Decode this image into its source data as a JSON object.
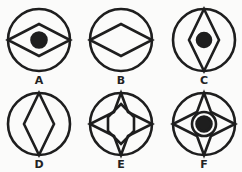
{
  "figures": [
    {
      "label": "A",
      "cx": 39,
      "cy": 40,
      "r": 33,
      "shape": "horizontal-diamond",
      "dot": true
    },
    {
      "label": "B",
      "cx": 120,
      "cy": 40,
      "r": 31,
      "shape": "horizontal-diamond",
      "dot": false
    },
    {
      "label": "C",
      "cx": 202,
      "cy": 40,
      "r": 31,
      "shape": "vertical-diamond",
      "dot": true
    },
    {
      "label": "D",
      "cx": 39,
      "cy": 125,
      "r": 31,
      "shape": "vertical-diamond",
      "dot": false
    },
    {
      "label": "E",
      "cx": 120,
      "cy": 125,
      "r": 31,
      "shape": "four-point-star",
      "dot": false
    },
    {
      "label": "F",
      "cx": 202,
      "cy": 125,
      "r": 31,
      "shape": "four-point-star",
      "dot": true
    }
  ],
  "colors": {
    "stroke": "#1e1e1e",
    "background": "#fbfbfa"
  }
}
